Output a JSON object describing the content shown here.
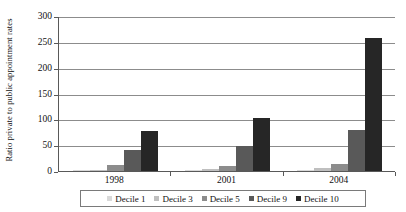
{
  "chart_data": {
    "type": "bar",
    "title": "",
    "subtitle": "",
    "xlabel": "",
    "ylabel": "Ratio private to public appointment rates",
    "categories": [
      "1998",
      "2001",
      "2004"
    ],
    "series": [
      {
        "name": "Decile 1",
        "color": "#d9d9d9",
        "values": [
          1,
          1,
          2
        ]
      },
      {
        "name": "Decile 3",
        "color": "#bfbfbf",
        "values": [
          2,
          3,
          5
        ]
      },
      {
        "name": "Decile 5",
        "color": "#8c8c8c",
        "values": [
          11,
          10,
          14
        ]
      },
      {
        "name": "Decile 9",
        "color": "#595959",
        "values": [
          41,
          48,
          80
        ]
      },
      {
        "name": "Decile 10",
        "color": "#262626",
        "values": [
          77,
          103,
          257
        ]
      }
    ],
    "ylim": [
      0,
      300
    ],
    "yticks": [
      0,
      50,
      100,
      150,
      200,
      250,
      300
    ],
    "ytick_labels": [
      "0",
      "50",
      "100",
      "150",
      "200",
      "250",
      "300"
    ],
    "grid": true,
    "grid_axis": "y",
    "legend_position": "bottom",
    "legend_border": true,
    "background_color": "#ffffff",
    "axis_color": "#595959",
    "grid_color": "#8c8c8c"
  }
}
